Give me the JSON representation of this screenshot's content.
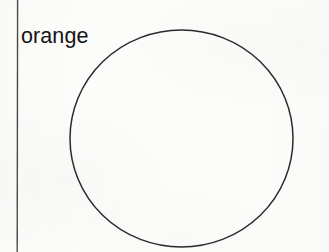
{
  "figure": {
    "background_color": "#fcfcfb",
    "ink_color": "#2b2b2b",
    "text_color": "#141414",
    "width": 329,
    "height": 252
  },
  "label": {
    "text": "orange",
    "x": 21,
    "y": 24,
    "font_size": 21.5
  },
  "margin_rule": {
    "name": "vertical-rule",
    "x": 17.5,
    "y_start": 0,
    "y_end": 252,
    "stroke_width": 1.4,
    "color": "#4a4a4a"
  },
  "shapes": [
    {
      "type": "circle",
      "name": "circle-outline",
      "center_x": 181.5,
      "center_y": 138.5,
      "radius_x": 111.5,
      "radius_y": 108.5,
      "stroke_width": 1.5,
      "stroke_color": "#2b2b2b",
      "fill": "none"
    }
  ]
}
